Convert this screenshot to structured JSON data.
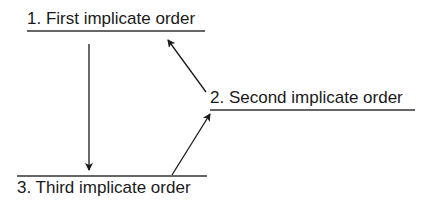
{
  "diagram": {
    "nodes": [
      {
        "id": "first",
        "number": "1.",
        "text": "First implicate order",
        "label": "1.  First implicate order"
      },
      {
        "id": "second",
        "number": "2.",
        "text": "Second implicate order",
        "label": "2. Second implicate order"
      },
      {
        "id": "third",
        "number": "3.",
        "text": "Third implicate order",
        "label": "3.  Third implicate order"
      }
    ],
    "edges": [
      {
        "from": "first",
        "to": "third"
      },
      {
        "from": "third",
        "to": "second"
      },
      {
        "from": "second",
        "to": "first"
      }
    ],
    "colors": {
      "line": "#1a1a1a",
      "text": "#1a1a1a",
      "background": "#ffffff"
    }
  }
}
